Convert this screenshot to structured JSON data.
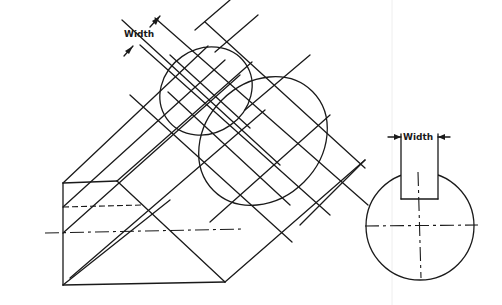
{
  "drawing": {
    "title": "",
    "isometric_view": {
      "dimension_label": "Width"
    },
    "end_view": {
      "dimension_label": "Width"
    },
    "line_color": "#1a1a1a",
    "background": "#ffffff"
  }
}
